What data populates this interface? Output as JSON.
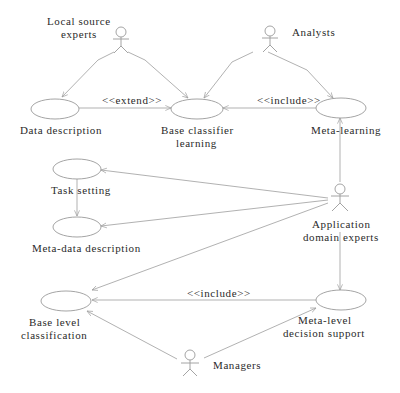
{
  "diagram": {
    "type": "uml-use-case",
    "actors": [
      {
        "id": "local_source_experts",
        "label_lines": [
          "Local source",
          "experts"
        ]
      },
      {
        "id": "analysts",
        "label_lines": [
          "Analysts"
        ]
      },
      {
        "id": "application_domain_experts",
        "label_lines": [
          "Application",
          "domain experts"
        ]
      },
      {
        "id": "managers",
        "label_lines": [
          "Managers"
        ]
      }
    ],
    "use_cases": [
      {
        "id": "data_description",
        "label_lines": [
          "Data description"
        ]
      },
      {
        "id": "base_classifier_learning",
        "label_lines": [
          "Base classifier",
          "learning"
        ]
      },
      {
        "id": "meta_learning",
        "label_lines": [
          "Meta-learning"
        ]
      },
      {
        "id": "task_setting",
        "label_lines": [
          "Task setting"
        ]
      },
      {
        "id": "meta_data_description",
        "label_lines": [
          "Meta-data description"
        ]
      },
      {
        "id": "base_level_classification",
        "label_lines": [
          "Base level",
          "classification"
        ]
      },
      {
        "id": "meta_level_decision_support",
        "label_lines": [
          "Meta-level",
          "decision support"
        ]
      }
    ],
    "relations": [
      {
        "from": "local_source_experts",
        "to": "data_description",
        "label": ""
      },
      {
        "from": "local_source_experts",
        "to": "base_classifier_learning",
        "label": ""
      },
      {
        "from": "analysts",
        "to": "base_classifier_learning",
        "label": ""
      },
      {
        "from": "analysts",
        "to": "meta_learning",
        "label": ""
      },
      {
        "from": "data_description",
        "to": "base_classifier_learning",
        "label": "<<extend>>"
      },
      {
        "from": "meta_learning",
        "to": "base_classifier_learning",
        "label": "<<include>>"
      },
      {
        "from": "application_domain_experts",
        "to": "meta_learning",
        "label": ""
      },
      {
        "from": "application_domain_experts",
        "to": "task_setting",
        "label": ""
      },
      {
        "from": "application_domain_experts",
        "to": "meta_data_description",
        "label": ""
      },
      {
        "from": "application_domain_experts",
        "to": "base_level_classification",
        "label": ""
      },
      {
        "from": "application_domain_experts",
        "to": "meta_level_decision_support",
        "label": ""
      },
      {
        "from": "task_setting",
        "to": "meta_data_description",
        "label": ""
      },
      {
        "from": "meta_level_decision_support",
        "to": "base_level_classification",
        "label": "<<include>>"
      },
      {
        "from": "managers",
        "to": "base_level_classification",
        "label": ""
      },
      {
        "from": "managers",
        "to": "meta_level_decision_support",
        "label": ""
      }
    ],
    "edge_labels": {
      "extend": "<<extend>>",
      "include_top": "<<include>>",
      "include_bottom": "<<include>>"
    },
    "colors": {
      "line": "#a8a8a8",
      "text": "#2a2a2a",
      "background": "#ffffff"
    }
  }
}
